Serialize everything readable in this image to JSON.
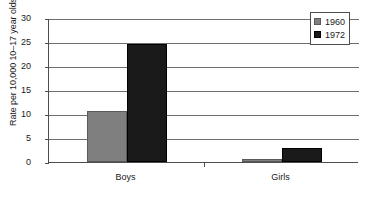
{
  "chart_data": {
    "type": "bar",
    "title": "",
    "subtitle": "",
    "xlabel": "",
    "ylabel": "Rate per 10,000 10–17 year olds",
    "categories": [
      "Boys",
      "Girls"
    ],
    "series": [
      {
        "name": "1960",
        "color": "#7f7f7f",
        "values": [
          10.6,
          0.7
        ]
      },
      {
        "name": "1972",
        "color": "#1a1a1a",
        "values": [
          24.5,
          2.9
        ]
      }
    ],
    "ylim": [
      0,
      30
    ],
    "ytick_values": [
      0,
      5,
      10,
      15,
      20,
      25,
      30
    ],
    "ytick_labels": [
      "0",
      "5",
      "10",
      "15",
      "20",
      "25",
      "30"
    ],
    "grid": true,
    "grid_axis": "y",
    "legend_position": "top-right",
    "legend_entries": [
      "1960",
      "1972"
    ],
    "annotations": []
  },
  "legend": {
    "items": [
      {
        "label": "1960",
        "swatch": "legend-swatch-1960"
      },
      {
        "label": "1972",
        "swatch": "legend-swatch-1972"
      }
    ]
  },
  "axes": {
    "y_title": "Rate per 10,000 10–17 year olds",
    "y_ticks": [
      "0",
      "5",
      "10",
      "15",
      "20",
      "25",
      "30"
    ],
    "x_categories": [
      "Boys",
      "Girls"
    ]
  },
  "colors": {
    "series_1960": "#7f7f7f",
    "series_1972": "#1a1a1a",
    "axis": "#4d4d4d",
    "grid": "#6e6e6e",
    "background": "#ffffff",
    "text": "#1a1a1a"
  }
}
